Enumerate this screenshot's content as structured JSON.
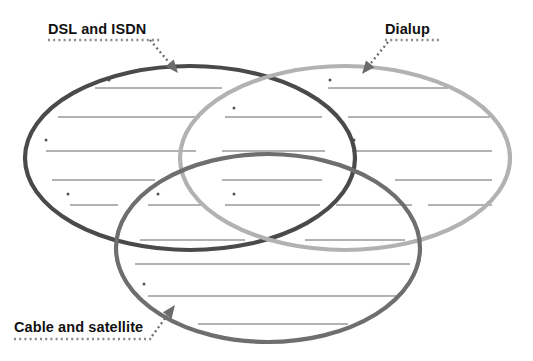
{
  "worksheet": {
    "title": "Internet connection types Venn diagram worksheet",
    "background_color": "#ffffff",
    "width": 533,
    "height": 361
  },
  "labels": [
    {
      "id": "dsl-isdn",
      "text": "DSL and ISDN",
      "color": "#111111",
      "x": 48,
      "y": 34,
      "underline": {
        "x1": 48,
        "x2": 160,
        "y": 40,
        "style": "dotted",
        "color": "#8a8a8a"
      },
      "arrow": {
        "style": "dotted",
        "color": "#6b6b6b",
        "from_x": 150,
        "from_y": 40,
        "to_x": 178,
        "to_y": 73,
        "head": "solid-triangle",
        "points_to": "dsl-ellipse"
      }
    },
    {
      "id": "dialup",
      "text": "Dialup",
      "color": "#111111",
      "x": 385,
      "y": 34,
      "underline": {
        "x1": 385,
        "x2": 440,
        "y": 40,
        "style": "dotted",
        "color": "#8a8a8a"
      },
      "arrow": {
        "style": "dotted",
        "color": "#6b6b6b",
        "from_x": 388,
        "from_y": 42,
        "to_x": 362,
        "to_y": 74,
        "head": "solid-triangle",
        "points_to": "dialup-ellipse"
      }
    },
    {
      "id": "cable-satellite",
      "text": "Cable and satellite",
      "color": "#111111",
      "x": 14,
      "y": 332,
      "underline": {
        "x1": 14,
        "x2": 152,
        "y": 339,
        "style": "dotted",
        "color": "#8a8a8a"
      },
      "arrow": {
        "style": "dotted",
        "color": "#6b6b6b",
        "from_x": 152,
        "from_y": 336,
        "to_x": 175,
        "to_y": 305,
        "head": "solid-triangle",
        "points_to": "cable-ellipse"
      }
    }
  ],
  "ellipses": [
    {
      "id": "dsl-ellipse",
      "name": "DSL and ISDN",
      "cx": 190,
      "cy": 158,
      "rx": 165,
      "ry": 92,
      "stroke": "#4a4a4a",
      "stroke_width": 4.2,
      "fill": "none"
    },
    {
      "id": "dialup-ellipse",
      "name": "Dialup",
      "cx": 345,
      "cy": 158,
      "rx": 165,
      "ry": 92,
      "stroke": "#b2b2b2",
      "stroke_width": 4.2,
      "fill": "none"
    },
    {
      "id": "cable-ellipse",
      "name": "Cable and satellite",
      "cx": 268,
      "cy": 248,
      "rx": 152,
      "ry": 94,
      "stroke": "#6e6e6e",
      "stroke_width": 4.2,
      "fill": "none"
    }
  ],
  "rule_lines": {
    "color": "#555555",
    "stroke_width": 0.9,
    "bullet_color": "#555555",
    "bullet_radius": 1.5,
    "rows": [
      {
        "row": 1,
        "y": 88,
        "segments": [
          {
            "region": "dsl-only",
            "x1": 95,
            "x2": 222,
            "bullet_x": 109,
            "bullet_y": 80
          },
          {
            "region": "dialup-only",
            "x1": 328,
            "x2": 448,
            "bullet_x": 330,
            "bullet_y": 80
          }
        ]
      },
      {
        "row": 2,
        "y": 117,
        "segments": [
          {
            "region": "dsl-only",
            "x1": 58,
            "x2": 200,
            "bullet_x": null,
            "bullet_y": null
          },
          {
            "region": "dsl-dialup",
            "x1": 225,
            "x2": 322,
            "bullet_x": 234,
            "bullet_y": 108
          },
          {
            "region": "dialup-only",
            "x1": 348,
            "x2": 490,
            "bullet_x": null,
            "bullet_y": null
          }
        ]
      },
      {
        "row": 3,
        "y": 151,
        "segments": [
          {
            "region": "dsl-only",
            "x1": 46,
            "x2": 196,
            "bullet_x": 46,
            "bullet_y": 140
          },
          {
            "region": "dsl-dialup",
            "x1": 222,
            "x2": 325,
            "bullet_x": null,
            "bullet_y": null
          },
          {
            "region": "dialup-only",
            "x1": 352,
            "x2": 492,
            "bullet_x": 354,
            "bullet_y": 140
          }
        ]
      },
      {
        "row": 4,
        "y": 180,
        "segments": [
          {
            "region": "dsl-only",
            "x1": 52,
            "x2": 155,
            "bullet_x": null,
            "bullet_y": null
          },
          {
            "region": "dsl-cable",
            "x1": 222,
            "x2": 322,
            "bullet_x": null,
            "bullet_y": null
          },
          {
            "region": "dialup-cable",
            "x1": 395,
            "x2": 492,
            "bullet_x": null,
            "bullet_y": null
          }
        ]
      },
      {
        "row": 5,
        "y": 205,
        "segments": [
          {
            "region": "dsl-only",
            "x1": 70,
            "x2": 118,
            "bullet_x": 68,
            "bullet_y": 194
          },
          {
            "region": "dsl-cable",
            "x1": 148,
            "x2": 202,
            "bullet_x": 158,
            "bullet_y": 194
          },
          {
            "region": "center-all",
            "x1": 225,
            "x2": 320,
            "bullet_x": 234,
            "bullet_y": 194
          },
          {
            "region": "dialup-cable",
            "x1": 336,
            "x2": 412,
            "bullet_x": 342,
            "bullet_y": 194
          },
          {
            "region": "dialup-only",
            "x1": 428,
            "x2": 492,
            "bullet_x": null,
            "bullet_y": null
          }
        ]
      },
      {
        "row": 6,
        "y": 240,
        "segments": [
          {
            "region": "dsl-cable",
            "x1": 140,
            "x2": 245,
            "bullet_x": null,
            "bullet_y": null
          },
          {
            "region": "dialup-cable",
            "x1": 305,
            "x2": 405,
            "bullet_x": null,
            "bullet_y": null
          }
        ]
      },
      {
        "row": 7,
        "y": 264,
        "segments": [
          {
            "region": "cable-only",
            "x1": 135,
            "x2": 410,
            "bullet_x": null,
            "bullet_y": null
          }
        ]
      },
      {
        "row": 8,
        "y": 296,
        "segments": [
          {
            "region": "cable-only",
            "x1": 148,
            "x2": 398,
            "bullet_x": 144,
            "bullet_y": 284
          }
        ]
      },
      {
        "row": 9,
        "y": 324,
        "segments": [
          {
            "region": "cable-only",
            "x1": 198,
            "x2": 348,
            "bullet_x": null,
            "bullet_y": null
          }
        ]
      }
    ]
  }
}
